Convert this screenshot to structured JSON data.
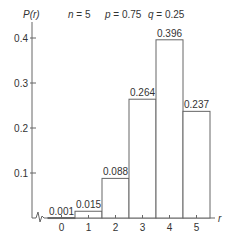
{
  "chart_data": {
    "type": "bar",
    "title": "n = 5   p = 0.75   q = 0.25",
    "params": {
      "n": "n = 5",
      "p": "p = 0.75",
      "q": "q = 0.25"
    },
    "ylabel": "P(r)",
    "xlabel": "r",
    "categories": [
      "0",
      "1",
      "2",
      "3",
      "4",
      "5"
    ],
    "values": [
      0.001,
      0.015,
      0.088,
      0.264,
      0.396,
      0.237
    ],
    "value_labels": [
      "0.001",
      "0.015",
      "0.088",
      "0.264",
      "0.396",
      "0.237"
    ],
    "yticks": [
      "0.1",
      "0.2",
      "0.3",
      "0.4"
    ],
    "ylim": [
      0,
      0.4
    ],
    "grid": false,
    "legend": null,
    "axis_break": true
  },
  "colors": {
    "line": "#555555",
    "text": "#333333",
    "bar_fill": "#ffffff"
  }
}
